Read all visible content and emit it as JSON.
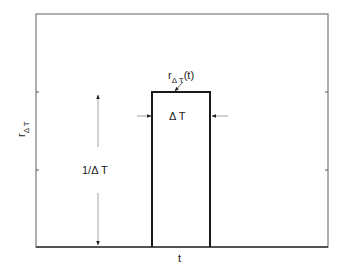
{
  "diagram": {
    "type": "rectangular-pulse",
    "axes": {
      "x_label": "t",
      "y_label_main": "r",
      "y_label_sub": "Δ T"
    },
    "pulse": {
      "curve_label_main": "r",
      "curve_label_sub": "Δ T",
      "curve_label_suffix": "(t)",
      "width_label": "Δ T",
      "height_label": "1/Δ T"
    },
    "colors": {
      "frame": "#7a7a7a",
      "pulse": "#1a1a1a",
      "baseline": "#333333",
      "arrow": "#999999",
      "text": "#222222"
    }
  }
}
